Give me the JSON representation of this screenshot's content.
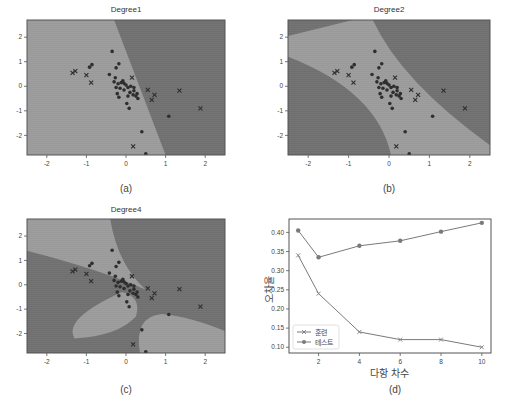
{
  "colors": {
    "region_light": "#9a9a9a",
    "region_dark": "#6f6f6f",
    "marker": "#2e2e2e",
    "line": "#7a7a7a",
    "axes": "#555555"
  },
  "panels": {
    "a": {
      "title": "Degree1",
      "caption": "(a)"
    },
    "b": {
      "title": "Degree2",
      "caption": "(b)"
    },
    "c": {
      "title": "Degree4",
      "caption": "(c)"
    },
    "d": {
      "caption": "(d)"
    }
  },
  "scatter_axes": {
    "xticks": [
      "-2",
      "-1",
      "0",
      "1",
      "2"
    ],
    "yticks": [
      "2",
      "1",
      "0",
      "-1",
      "-2"
    ],
    "xlim": [
      -2.5,
      2.5
    ],
    "ylim": [
      -2.8,
      2.7
    ]
  },
  "chart_data": [
    {
      "type": "scatter",
      "title": "Degree1",
      "xlim": [
        -2.5,
        2.5
      ],
      "ylim": [
        -2.8,
        2.7
      ],
      "xticks": [
        -2,
        -1,
        0,
        1,
        2
      ],
      "yticks": [
        -2,
        -1,
        0,
        1,
        2
      ],
      "description": "Linear decision boundary; lighter class region on left, darker on right"
    },
    {
      "type": "scatter",
      "title": "Degree2",
      "xlim": [
        -2.5,
        2.5
      ],
      "ylim": [
        -2.8,
        2.7
      ],
      "xticks": [
        -2,
        -1,
        0,
        1,
        2
      ],
      "yticks": [
        -2,
        -1,
        0,
        1,
        2
      ],
      "description": "Quadratic decision boundary; lighter diagonal band from upper-left to lower-right"
    },
    {
      "type": "scatter",
      "title": "Degree4",
      "xlim": [
        -2.5,
        2.5
      ],
      "ylim": [
        -2.8,
        2.7
      ],
      "xticks": [
        -2,
        -1,
        0,
        1,
        2
      ],
      "yticks": [
        -2,
        -1,
        0,
        1,
        2
      ],
      "description": "4th-degree decision boundary; lighter lobes upper-left, lower-center and lower-right"
    },
    {
      "type": "line",
      "title": "",
      "xlabel": "다항 차수",
      "ylabel": "오차율",
      "x": [
        1,
        2,
        4,
        6,
        8,
        10
      ],
      "xticks": [
        2,
        4,
        6,
        8,
        10
      ],
      "yticks": [
        0.1,
        0.15,
        0.2,
        0.25,
        0.3,
        0.35,
        0.4
      ],
      "ylim": [
        0.085,
        0.435
      ],
      "legend_position": "lower left",
      "series": [
        {
          "name": "훈련",
          "marker": "x",
          "values": [
            0.34,
            0.24,
            0.14,
            0.12,
            0.12,
            0.1
          ]
        },
        {
          "name": "테스트",
          "marker": "o",
          "values": [
            0.405,
            0.335,
            0.365,
            0.378,
            0.402,
            0.425
          ]
        }
      ]
    }
  ],
  "line_chart": {
    "xlabel": "다항 차수",
    "ylabel": "오차율",
    "xticks": [
      "2",
      "4",
      "6",
      "8",
      "10"
    ],
    "yticks": [
      "0.40",
      "0.35",
      "0.30",
      "0.25",
      "0.20",
      "0.15",
      "0.10"
    ],
    "legend": [
      "훈련",
      "테스트"
    ]
  }
}
